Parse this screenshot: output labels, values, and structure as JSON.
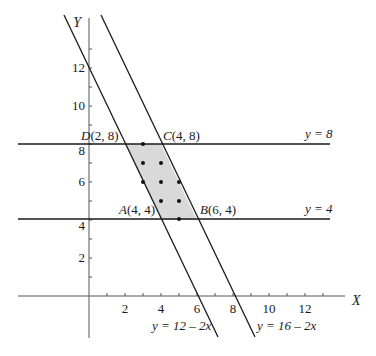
{
  "axes": {
    "x_label": "X",
    "y_label": "Y",
    "x_ticks": [
      {
        "value": 2,
        "label": "2"
      },
      {
        "value": 4,
        "label": "4"
      },
      {
        "value": 6,
        "label": "6"
      },
      {
        "value": 8,
        "label": "8"
      },
      {
        "value": 10,
        "label": "10"
      },
      {
        "value": 12,
        "label": "12"
      }
    ],
    "y_ticks": [
      {
        "value": 2,
        "label": "2"
      },
      {
        "value": 4,
        "label": "4"
      },
      {
        "value": 6,
        "label": "6"
      },
      {
        "value": 8,
        "label": "8"
      },
      {
        "value": 10,
        "label": "10"
      },
      {
        "value": 12,
        "label": "12"
      }
    ]
  },
  "lines": [
    {
      "id": "l1",
      "equation": "y = 12 – 2x"
    },
    {
      "id": "l2",
      "equation": "y = 16 – 2x"
    },
    {
      "id": "h8",
      "equation": "y = 8"
    },
    {
      "id": "h4",
      "equation": "y = 4"
    }
  ],
  "vertices": {
    "A": {
      "name": "A",
      "coords": "(4, 4)"
    },
    "B": {
      "name": "B",
      "coords": "(6, 4)"
    },
    "C": {
      "name": "C",
      "coords": "(4, 8)"
    },
    "D": {
      "name": "D",
      "coords": "(2, 8)"
    }
  },
  "region": {
    "fill": "#d9d9d9",
    "lattice_points": [
      [
        3,
        8
      ],
      [
        3,
        7
      ],
      [
        4,
        7
      ],
      [
        3,
        6
      ],
      [
        4,
        6
      ],
      [
        5,
        6
      ],
      [
        4,
        5
      ],
      [
        5,
        5
      ],
      [
        5,
        4
      ]
    ]
  },
  "colors": {
    "line": "#1a1a1a",
    "axis": "#555555"
  }
}
